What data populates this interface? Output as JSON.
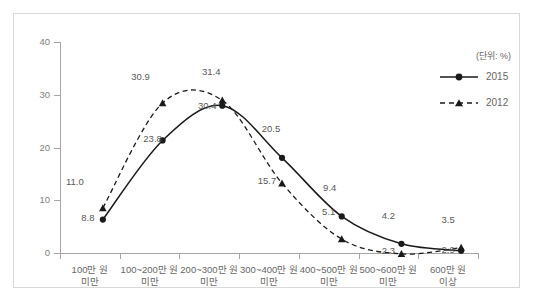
{
  "chart_data": {
    "type": "line",
    "title": "",
    "subtitle": "",
    "unit_note": "(단위: %)",
    "xlabel": "",
    "ylabel": "",
    "ylim": [
      0,
      40
    ],
    "yticks": [
      0,
      10,
      20,
      30,
      40
    ],
    "ytick_labels": [
      "0",
      "10",
      "20",
      "30",
      "40"
    ],
    "grid": false,
    "legend_position": "top-right",
    "categories": [
      "100만 원\n미만",
      "100~200만 원\n미만",
      "200~300만 원\n미만",
      "300~400만 원\n미만",
      "400~500만 원\n미만",
      "500~600만 원\n미만",
      "600만 원\n이상"
    ],
    "category_lines": [
      [
        "100만 원",
        "미만"
      ],
      [
        "100~200만 원",
        "미만"
      ],
      [
        "200~300만 원",
        "미만"
      ],
      [
        "300~400만 원",
        "미만"
      ],
      [
        "400~500만 원",
        "미만"
      ],
      [
        "500~600만 원",
        "미만"
      ],
      [
        "600만 원",
        "이상"
      ]
    ],
    "series": [
      {
        "name": "2015",
        "style": "solid",
        "marker": "circle",
        "color": "#1a1a1a",
        "values": [
          8.8,
          23.8,
          30.4,
          20.5,
          9.4,
          4.2,
          2.9
        ],
        "labels": [
          "8.8",
          "23.8",
          "30.4",
          "20.5",
          "9.4",
          "4.2",
          "2.9"
        ]
      },
      {
        "name": "2012",
        "style": "dashed",
        "marker": "triangle",
        "color": "#1a1a1a",
        "values": [
          11.0,
          30.9,
          31.4,
          15.7,
          5.1,
          2.3,
          3.5
        ],
        "labels": [
          "11.0",
          "30.9",
          "31.4",
          "15.7",
          "5.1",
          "2.3",
          "3.5"
        ]
      }
    ]
  },
  "legend": {
    "items": [
      {
        "label": "2015"
      },
      {
        "label": "2012"
      }
    ]
  },
  "axis": {
    "unit_note": "(단위: %)"
  },
  "caption": {
    "text": ""
  }
}
